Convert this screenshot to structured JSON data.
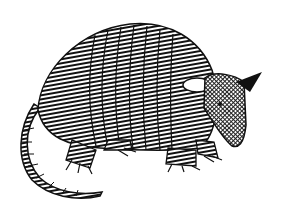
{
  "image": {
    "subject": "armadillo",
    "style": "black-and-white pen-and-ink illustration",
    "background_color": "#ffffff",
    "ink_color": "#111111",
    "alt_text": "Pen-and-ink drawing of an armadillo facing right, with banded shell, long segmented tail, clawed feet and a pointed snout"
  }
}
